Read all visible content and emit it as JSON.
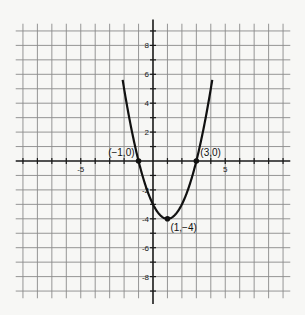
{
  "chart_data": {
    "type": "line",
    "title": "",
    "xlabel": "",
    "ylabel": "",
    "xlim": [
      -9,
      9
    ],
    "ylim": [
      -9,
      9
    ],
    "grid": true,
    "x_tick_labels": [
      {
        "value": -5,
        "text": "-5"
      },
      {
        "value": 5,
        "text": "5"
      }
    ],
    "y_tick_labels": [
      {
        "value": 8,
        "text": "8"
      },
      {
        "value": 6,
        "text": "6"
      },
      {
        "value": 4,
        "text": "4"
      },
      {
        "value": 2,
        "text": "2"
      },
      {
        "value": -2,
        "text": "-2"
      },
      {
        "value": -4,
        "text": "-4"
      },
      {
        "value": -6,
        "text": "-6"
      },
      {
        "value": -8,
        "text": "-8"
      }
    ],
    "series": [
      {
        "name": "parabola",
        "function": "y = (x - 1)^2 - 4",
        "a": 1,
        "h": 1,
        "k": -4,
        "x_range": [
          -2.1,
          4.1
        ]
      }
    ],
    "points": [
      {
        "x": -1,
        "y": 0,
        "label": "(−1,0)",
        "label_pos": "upper-left"
      },
      {
        "x": 3,
        "y": 0,
        "label": "(3,0)",
        "label_pos": "upper-right"
      },
      {
        "x": 1,
        "y": -4,
        "label": "(1,−4)",
        "label_pos": "lower-right"
      }
    ]
  }
}
